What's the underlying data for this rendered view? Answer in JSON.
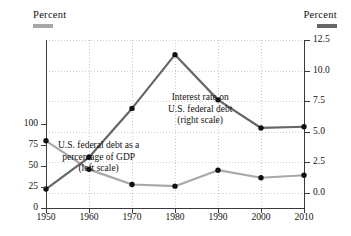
{
  "header": {
    "left_label": "Percent",
    "right_label": "Percent",
    "left_swatch_color": "#a8a8a8",
    "right_swatch_color": "#666666"
  },
  "annotations": {
    "interest": [
      "Interest rate on",
      "U.S. federal debt",
      "(right scale)"
    ],
    "debt": [
      "U.S. federal debt as a",
      "percentage of GDP",
      "(left scale)"
    ]
  },
  "axes": {
    "x_ticks": [
      "1950",
      "1960",
      "1970",
      "1980",
      "1990",
      "2000",
      "2010"
    ],
    "y_left_ticks": [
      "100",
      "75",
      "50",
      "25",
      "0"
    ],
    "y_right_ticks": [
      "12.5",
      "10.0",
      "7.5",
      "5.0",
      "2.5",
      "0.0"
    ]
  },
  "chart_data": {
    "type": "line",
    "title": "",
    "xlabel": "",
    "ylabel": "Percent",
    "x": [
      1950,
      1960,
      1970,
      1980,
      1990,
      2000,
      2010
    ],
    "categories": [
      "1950",
      "1960",
      "1970",
      "1980",
      "1990",
      "2000",
      "2010"
    ],
    "grid": true,
    "legend_position": "top-corners",
    "series": [
      {
        "name": "U.S. federal debt as a percentage of GDP (left scale)",
        "axis": "left",
        "color": "#a8a8a8",
        "marker_color": "#111111",
        "values": [
          80,
          46,
          28,
          26,
          45,
          36,
          39
        ],
        "ylim": [
          0,
          200
        ],
        "yticks": [
          0,
          25,
          50,
          75,
          100
        ]
      },
      {
        "name": "Interest rate on U.S. federal debt (right scale)",
        "axis": "right",
        "color": "#666666",
        "marker_color": "#111111",
        "values": [
          0.3,
          2.9,
          6.9,
          11.3,
          7.6,
          5.3,
          5.4
        ],
        "ylim": [
          -1.25,
          12.5
        ],
        "yticks": [
          0.0,
          2.5,
          5.0,
          7.5,
          10.0,
          12.5
        ]
      }
    ]
  }
}
